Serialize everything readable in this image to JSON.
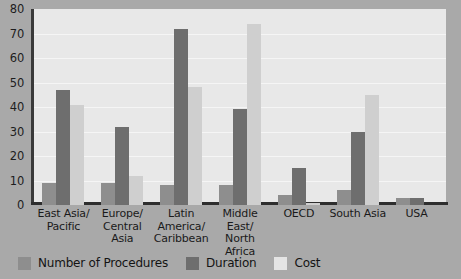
{
  "chart_data": {
    "type": "bar",
    "title": "",
    "subtitle": "",
    "xlabel": "",
    "ylabel": "",
    "ylim": [
      0,
      80
    ],
    "ytick_step": 10,
    "yticks": [
      "80",
      "70",
      "60",
      "50",
      "40",
      "30",
      "20",
      "10",
      "0"
    ],
    "grid": true,
    "legend_position": "bottom-left",
    "categories": [
      "East Asia/\nPacific",
      "Europe/\nCentral Asia",
      "Latin\nAmerica/\nCaribbean",
      "Middle East/\nNorth Africa",
      "OECD",
      "South Asia",
      "USA"
    ],
    "series": [
      {
        "name": "Number of Procedures",
        "color": "#8e8e8e",
        "values": [
          9,
          9,
          8,
          8,
          4,
          6,
          3
        ]
      },
      {
        "name": "Duration",
        "color": "#6e6e6e",
        "values": [
          47,
          32,
          72,
          39,
          15,
          30,
          3
        ]
      },
      {
        "name": "Cost",
        "color": "#cfcfcf",
        "values": [
          41,
          12,
          48,
          74,
          1,
          45,
          0
        ]
      }
    ]
  },
  "legend": {
    "items": [
      {
        "label": "Number of Procedures",
        "swatch": "procedures"
      },
      {
        "label": "Duration",
        "swatch": "duration"
      },
      {
        "label": "Cost",
        "swatch": "cost"
      }
    ]
  },
  "colors": {
    "background": "#a9a9a9",
    "plot_background": "#e8e8e8",
    "gridline": "#f5f5f5",
    "axis": "#2e2e2e",
    "procedures": "#8e8e8e",
    "duration": "#6e6e6e",
    "cost": "#cfcfcf"
  }
}
